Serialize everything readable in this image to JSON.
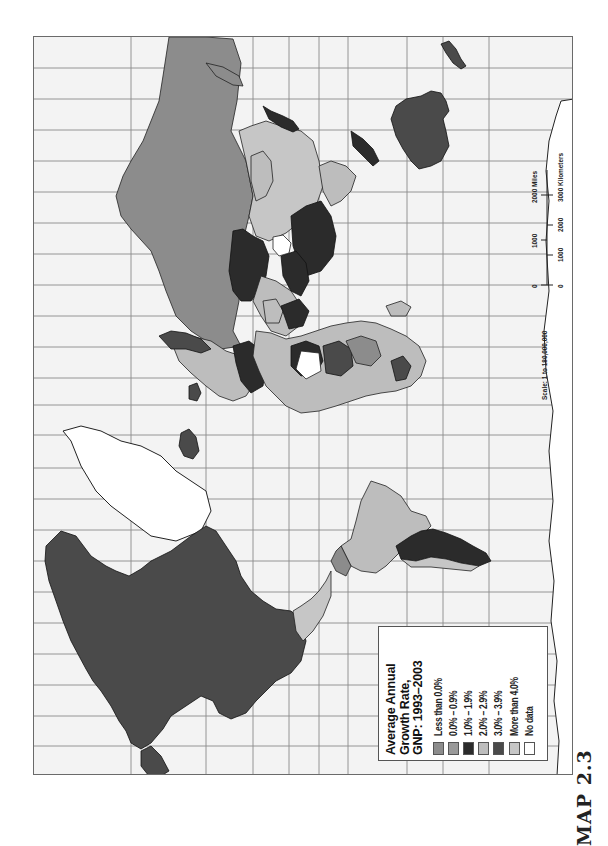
{
  "caption": {
    "figure_label": "MAP 2.3"
  },
  "map": {
    "projection_orientation": "rotated 90 degrees (north to the left)",
    "background_color": "#f3f3f3",
    "gridline_color": "#8a8a8a",
    "grid": {
      "horizontal_lines_y": [
        67,
        98,
        129,
        160,
        191,
        222,
        253,
        284,
        315,
        346,
        377,
        404,
        434,
        467,
        498,
        529,
        560,
        591,
        622,
        653,
        684,
        715,
        745
      ],
      "vertical_lines_x": [
        130,
        205,
        252,
        288,
        318,
        347,
        406,
        442,
        488
      ]
    }
  },
  "legend": {
    "title_line1": "Average Annual",
    "title_line2": "Growth Rate,",
    "title_line3": "GNP: 1993–2003",
    "items": [
      {
        "label": "Less than 0.0%",
        "color": "#8c8c8c"
      },
      {
        "label": "0.0% – 0.9%",
        "color": "#9a9a9a"
      },
      {
        "label": "1.0% – 1.9%",
        "color": "#2b2b2b"
      },
      {
        "label": "2.0% – 2.9%",
        "color": "#bdbdbd"
      },
      {
        "label": "3.0% – 3.9%",
        "color": "#4a4a4a"
      },
      {
        "label": "More than 4.0%",
        "color": "#c6c6c6"
      },
      {
        "label": "No data",
        "color": "#ffffff"
      }
    ]
  },
  "scale": {
    "ratio_label": "Scale: 1 to 180,000,000",
    "miles_ticks": [
      "0",
      "1000",
      "2000 Miles"
    ],
    "km_ticks": [
      "0",
      "1000",
      "2000",
      "3000 Kilometers"
    ]
  },
  "regions": [
    {
      "name": "North America (USA/Canada)",
      "class": "3.0% – 3.9%",
      "color": "#4a4a4a"
    },
    {
      "name": "Greenland",
      "class": "No data",
      "color": "#ffffff"
    },
    {
      "name": "Mexico/Central America",
      "class": "More than 4.0%",
      "color": "#c6c6c6"
    },
    {
      "name": "Brazil",
      "class": "2.0% – 2.9%",
      "color": "#bdbdbd"
    },
    {
      "name": "Argentina",
      "class": "1.0% – 1.9%",
      "color": "#2b2b2b"
    },
    {
      "name": "Russia",
      "class": "Less than 0.0%",
      "color": "#8c8c8c"
    },
    {
      "name": "China",
      "class": "More than 4.0%",
      "color": "#c6c6c6"
    },
    {
      "name": "India",
      "class": "1.0% – 1.9%",
      "color": "#2b2b2b"
    },
    {
      "name": "Africa (mixed)",
      "class": "mixed",
      "color": "#bdbdbd"
    },
    {
      "name": "Australia",
      "class": "3.0% – 3.9%",
      "color": "#4a4a4a"
    },
    {
      "name": "Antarctica",
      "class": "No data",
      "color": "#ffffff"
    }
  ]
}
